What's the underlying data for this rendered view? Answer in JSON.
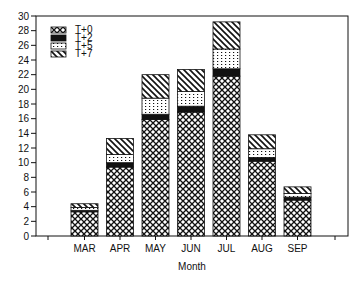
{
  "chart_data": {
    "type": "bar",
    "stacked": true,
    "title": "",
    "xlabel": "Month",
    "ylabel": "",
    "ylim": [
      0,
      30
    ],
    "yticks": [
      0,
      2,
      4,
      6,
      8,
      10,
      12,
      14,
      16,
      18,
      20,
      22,
      24,
      26,
      28,
      30
    ],
    "grid": false,
    "legend_position": "upper-left-inside",
    "categories": [
      "MAR",
      "APR",
      "MAY",
      "JUN",
      "JUL",
      "AUG",
      "SEP"
    ],
    "series": [
      {
        "name": "T+0",
        "pattern": "crosshatch",
        "values": [
          3.3,
          9.4,
          15.9,
          16.9,
          21.8,
          10.2,
          4.9
        ]
      },
      {
        "name": "T+2",
        "pattern": "solid-black",
        "values": [
          0.2,
          0.6,
          0.7,
          0.8,
          1.0,
          0.5,
          0.4
        ]
      },
      {
        "name": "T+5",
        "pattern": "dotted",
        "values": [
          0.4,
          1.1,
          2.2,
          2.0,
          2.7,
          1.2,
          0.5
        ]
      },
      {
        "name": "T+7",
        "pattern": "diagonal-hatch",
        "values": [
          0.5,
          2.2,
          3.2,
          3.0,
          3.7,
          1.9,
          0.9
        ]
      }
    ],
    "totals": [
      4.4,
      13.3,
      22.0,
      22.7,
      29.2,
      13.8,
      6.7
    ]
  },
  "colors": {
    "ink": "#111111",
    "background": "#ffffff"
  }
}
